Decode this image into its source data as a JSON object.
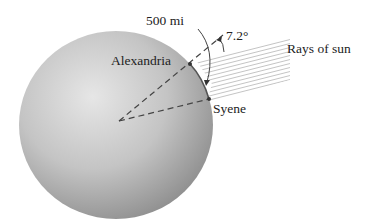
{
  "diagram": {
    "labels": {
      "distance": "500 mi",
      "angle": "7.2°",
      "rays": "Rays of sun",
      "city_north": "Alexandria",
      "city_south": "Syene"
    },
    "colors": {
      "sphere_light": "#e4e4e4",
      "sphere_dark": "#9a9a9a",
      "lines": "#444444",
      "rays": "#b8b8b8"
    }
  }
}
